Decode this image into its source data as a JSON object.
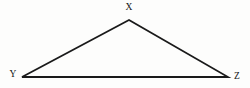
{
  "figure": {
    "kind": "geometry-diagram",
    "shape": "triangle",
    "name": "Triangle XYZ",
    "canvas": {
      "width": 250,
      "height": 88
    },
    "background_color": "#fdfdfc",
    "line_color": "#1a1a1a",
    "label_color": "#141414",
    "line_width": 1.8,
    "vertices": [
      {
        "id": "X",
        "label": "X",
        "x": 129,
        "y": 20,
        "label_x": 129,
        "label_y": 8,
        "label_anchor": "middle"
      },
      {
        "id": "Y",
        "label": "Y",
        "x": 22,
        "y": 77,
        "label_x": 13,
        "label_y": 75,
        "label_anchor": "middle"
      },
      {
        "id": "Z",
        "label": "Z",
        "x": 228,
        "y": 77,
        "label_x": 237,
        "label_y": 77,
        "label_anchor": "middle"
      }
    ],
    "edges": [
      {
        "id": "XY",
        "from": "X",
        "to": "Y"
      },
      {
        "id": "YZ",
        "from": "Y",
        "to": "Z"
      },
      {
        "id": "ZX",
        "from": "Z",
        "to": "X"
      }
    ],
    "polygon_points": "129,20 22,77 228,77"
  }
}
